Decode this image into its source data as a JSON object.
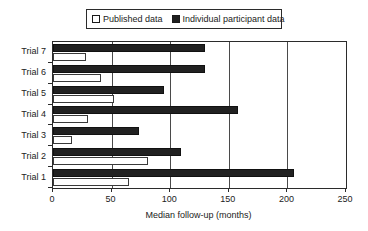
{
  "chart_data": {
    "type": "bar",
    "orientation": "horizontal",
    "title": "",
    "xlabel": "Median follow-up (months)",
    "ylabel": "",
    "xlim": [
      0,
      250
    ],
    "xticks": [
      0,
      50,
      100,
      150,
      200,
      250
    ],
    "xtick_labels": [
      "0",
      "50",
      "100",
      "150",
      "200",
      "250"
    ],
    "categories": [
      "Trial 1",
      "Trial 2",
      "Trial 3",
      "Trial 4",
      "Trial 5",
      "Trial 6",
      "Trial 7"
    ],
    "category_order_top_to_bottom": [
      "Trial 7",
      "Trial 6",
      "Trial 5",
      "Trial 4",
      "Trial 3",
      "Trial 2",
      "Trial 1"
    ],
    "grid": "vertical",
    "legend_position": "top-center",
    "series": [
      {
        "name": "Published data",
        "fill": "#ffffff",
        "edge": "#3a3a3a",
        "values": [
          65,
          81,
          16,
          30,
          52,
          41,
          28
        ]
      },
      {
        "name": "Individual participant data",
        "fill": "#212121",
        "edge": "#111111",
        "values": [
          206,
          109,
          73,
          158,
          95,
          130,
          130
        ]
      }
    ]
  },
  "legend": {
    "entries": [
      {
        "label": "Published data",
        "swatch": "published-swatch"
      },
      {
        "label": "Individual participant data",
        "swatch": "ipd-swatch"
      }
    ]
  },
  "axes": {
    "x_title": "Median follow-up (months)",
    "x_tick_labels": [
      "0",
      "50",
      "100",
      "150",
      "200",
      "250"
    ],
    "y_tick_labels": [
      "Trial 7",
      "Trial 6",
      "Trial 5",
      "Trial 4",
      "Trial 3",
      "Trial 2",
      "Trial 1"
    ]
  },
  "colors": {
    "published_fill": "#ffffff",
    "ipd_fill": "#212121",
    "axis": "#2b2b2b",
    "gridline": "#4a4a4a",
    "text": "#222222",
    "background": "#ffffff"
  }
}
